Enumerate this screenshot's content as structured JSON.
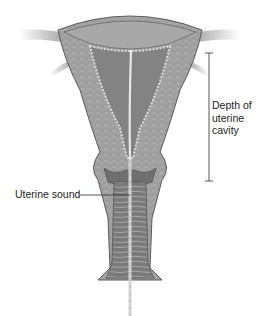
{
  "figure": {
    "labels": {
      "depth": "Depth of uterine cavity",
      "depth_lines": [
        "Depth of",
        "uterine",
        "cavity"
      ],
      "sound": "Uterine sound"
    },
    "colors": {
      "background": "#ffffff",
      "myometrium": "#9a9a9a",
      "myometrium_light": "#b4b4b4",
      "cavity": "#7e7e7e",
      "endometrium_edge": "#d8d8d8",
      "outline": "#5a5a5a",
      "leader_line": "#444444",
      "label_text": "#222222"
    }
  }
}
